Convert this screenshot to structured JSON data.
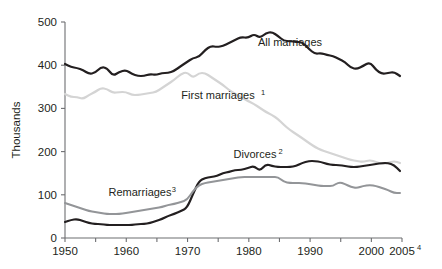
{
  "chart_data": {
    "type": "line",
    "title": "",
    "xlabel": "",
    "ylabel": "Thousands",
    "xlim": [
      1950,
      2005
    ],
    "ylim": [
      0,
      500
    ],
    "grid": false,
    "legend_position": "inline-annotations",
    "y_ticks": [
      "0",
      "100",
      "200",
      "300",
      "400",
      "500"
    ],
    "y_tick_values": [
      0,
      100,
      200,
      300,
      400,
      500
    ],
    "x_ticks": [
      "1950",
      "",
      "1960",
      "",
      "1970",
      "",
      "1980",
      "",
      "1990",
      "",
      "2000",
      "2005"
    ],
    "x_tick_values": [
      1950,
      1955,
      1960,
      1965,
      1970,
      1975,
      1980,
      1985,
      1990,
      1995,
      2000,
      2005
    ],
    "x_tick_labels_visible": [
      "1950",
      "1960",
      "1970",
      "1980",
      "1990",
      "2000",
      "2005"
    ],
    "x_last_label_superscript": "4",
    "series": [
      {
        "name": "All marriages",
        "label": "All marriages",
        "superscript": "",
        "color": "#231f20",
        "width": 2.2,
        "label_x": 290,
        "label_y": 46,
        "x": [
          1950,
          1951,
          1952,
          1953,
          1954,
          1955,
          1956,
          1957,
          1958,
          1959,
          1960,
          1961,
          1962,
          1963,
          1964,
          1965,
          1966,
          1967,
          1968,
          1969,
          1970,
          1971,
          1972,
          1973,
          1974,
          1975,
          1976,
          1977,
          1978,
          1979,
          1980,
          1981,
          1982,
          1983,
          1984,
          1985,
          1986,
          1987,
          1988,
          1989,
          1990,
          1991,
          1992,
          1993,
          1994,
          1995,
          1996,
          1997,
          1998,
          1999,
          2000,
          2001,
          2002,
          2003,
          2004,
          2005
        ],
        "values": [
          406,
          400,
          398,
          396,
          387,
          390,
          400,
          398,
          384,
          394,
          400,
          389,
          384,
          385,
          388,
          386,
          390,
          392,
          396,
          406,
          415,
          425,
          428,
          440,
          450,
          448,
          450,
          456,
          462,
          470,
          466,
          475,
          466,
          478,
          480,
          470,
          459,
          460,
          457,
          458,
          443,
          430,
          432,
          429,
          427,
          420,
          412,
          400,
          398,
          404,
          412,
          396,
          387,
          390,
          392,
          382
        ],
        "pixel_points": [
          [
            65,
            64
          ],
          [
            71,
            67
          ],
          [
            77,
            68
          ],
          [
            83,
            70
          ],
          [
            89,
            74
          ],
          [
            95,
            73
          ],
          [
            101,
            67
          ],
          [
            107,
            68
          ],
          [
            113,
            76
          ],
          [
            119,
            72
          ],
          [
            126,
            70
          ],
          [
            132,
            74
          ],
          [
            138,
            76
          ],
          [
            144,
            76
          ],
          [
            150,
            74
          ],
          [
            156,
            75
          ],
          [
            162,
            73
          ],
          [
            168,
            73
          ],
          [
            174,
            71
          ],
          [
            181,
            66
          ],
          [
            187,
            62
          ],
          [
            193,
            58
          ],
          [
            199,
            57
          ],
          [
            205,
            50
          ],
          [
            211,
            46
          ],
          [
            217,
            47
          ],
          [
            223,
            46
          ],
          [
            229,
            43
          ],
          [
            235,
            40
          ],
          [
            241,
            37
          ],
          [
            248,
            38
          ],
          [
            254,
            34
          ],
          [
            260,
            38
          ],
          [
            266,
            33
          ],
          [
            272,
            32
          ],
          [
            278,
            36
          ],
          [
            284,
            41
          ],
          [
            290,
            41
          ],
          [
            296,
            42
          ],
          [
            302,
            42
          ],
          [
            309,
            49
          ],
          [
            315,
            54
          ],
          [
            321,
            53
          ],
          [
            327,
            55
          ],
          [
            333,
            56
          ],
          [
            339,
            59
          ],
          [
            345,
            62
          ],
          [
            351,
            68
          ],
          [
            357,
            69
          ],
          [
            363,
            66
          ],
          [
            370,
            62
          ],
          [
            376,
            70
          ],
          [
            382,
            74
          ],
          [
            388,
            73
          ],
          [
            394,
            72
          ],
          [
            400,
            76
          ]
        ]
      },
      {
        "name": "First marriages",
        "label": "First marriages",
        "superscript": "1",
        "color": "#d4d4d4",
        "width": 2.2,
        "label_x": 218,
        "label_y": 99,
        "x": [
          1950,
          1955,
          1960,
          1965,
          1970,
          1975,
          1980,
          1985,
          1990,
          1995,
          2000,
          2005
        ],
        "values": [
          333,
          338,
          336,
          344,
          380,
          375,
          345,
          310,
          270,
          230,
          200,
          180
        ],
        "pixel_points": [
          [
            65,
            94
          ],
          [
            71,
            97
          ],
          [
            77,
            97
          ],
          [
            83,
            99
          ],
          [
            89,
            95
          ],
          [
            95,
            92
          ],
          [
            101,
            88
          ],
          [
            107,
            89
          ],
          [
            113,
            93
          ],
          [
            119,
            92
          ],
          [
            126,
            92
          ],
          [
            132,
            95
          ],
          [
            138,
            95
          ],
          [
            144,
            94
          ],
          [
            150,
            93
          ],
          [
            156,
            92
          ],
          [
            162,
            88
          ],
          [
            168,
            84
          ],
          [
            174,
            80
          ],
          [
            181,
            74
          ],
          [
            187,
            72
          ],
          [
            193,
            78
          ],
          [
            199,
            73
          ],
          [
            205,
            73
          ],
          [
            211,
            77
          ],
          [
            217,
            81
          ],
          [
            223,
            85
          ],
          [
            229,
            90
          ],
          [
            235,
            94
          ],
          [
            241,
            97
          ],
          [
            248,
            101
          ],
          [
            254,
            104
          ],
          [
            260,
            108
          ],
          [
            266,
            112
          ],
          [
            272,
            115
          ],
          [
            278,
            119
          ],
          [
            284,
            125
          ],
          [
            290,
            130
          ],
          [
            296,
            134
          ],
          [
            302,
            138
          ],
          [
            309,
            143
          ],
          [
            315,
            147
          ],
          [
            321,
            150
          ],
          [
            327,
            152
          ],
          [
            333,
            154
          ],
          [
            339,
            156
          ],
          [
            345,
            158
          ],
          [
            351,
            160
          ],
          [
            357,
            161
          ],
          [
            363,
            162
          ],
          [
            370,
            160
          ],
          [
            376,
            162
          ],
          [
            382,
            164
          ],
          [
            388,
            163
          ],
          [
            394,
            161
          ],
          [
            400,
            163
          ]
        ]
      },
      {
        "name": "Divorces",
        "label": "Divorces",
        "superscript": "2",
        "color": "#231f20",
        "width": 2.2,
        "label_x": 255,
        "label_y": 158,
        "x": [
          1950,
          1955,
          1960,
          1965,
          1970,
          1975,
          1980,
          1985,
          1990,
          1995,
          2000,
          2005
        ],
        "values": [
          35,
          30,
          28,
          33,
          48,
          110,
          125,
          128,
          125,
          123,
          120,
          118
        ],
        "pixel_points": [
          [
            65,
            222
          ],
          [
            71,
            220
          ],
          [
            77,
            219
          ],
          [
            83,
            221
          ],
          [
            89,
            223
          ],
          [
            95,
            224
          ],
          [
            101,
            224
          ],
          [
            107,
            225
          ],
          [
            113,
            225
          ],
          [
            119,
            225
          ],
          [
            126,
            225
          ],
          [
            132,
            225
          ],
          [
            138,
            224
          ],
          [
            144,
            224
          ],
          [
            150,
            223
          ],
          [
            156,
            221
          ],
          [
            162,
            219
          ],
          [
            168,
            216
          ],
          [
            174,
            214
          ],
          [
            181,
            211
          ],
          [
            187,
            208
          ],
          [
            193,
            194
          ],
          [
            199,
            181
          ],
          [
            205,
            178
          ],
          [
            211,
            177
          ],
          [
            217,
            176
          ],
          [
            223,
            173
          ],
          [
            229,
            172
          ],
          [
            235,
            170
          ],
          [
            241,
            170
          ],
          [
            248,
            168
          ],
          [
            254,
            166
          ],
          [
            260,
            171
          ],
          [
            266,
            164
          ],
          [
            272,
            166
          ],
          [
            278,
            167
          ],
          [
            284,
            167
          ],
          [
            290,
            167
          ],
          [
            296,
            166
          ],
          [
            302,
            163
          ],
          [
            309,
            161
          ],
          [
            315,
            161
          ],
          [
            321,
            162
          ],
          [
            327,
            164
          ],
          [
            333,
            165
          ],
          [
            339,
            165
          ],
          [
            345,
            166
          ],
          [
            351,
            167
          ],
          [
            357,
            167
          ],
          [
            363,
            166
          ],
          [
            370,
            165
          ],
          [
            376,
            164
          ],
          [
            382,
            163
          ],
          [
            388,
            163
          ],
          [
            394,
            165
          ],
          [
            400,
            171
          ]
        ]
      },
      {
        "name": "Remarriages",
        "label": "Remarriages",
        "superscript": "3",
        "color": "#939598",
        "width": 2.0,
        "label_x": 140,
        "label_y": 196,
        "x": [
          1950,
          1955,
          1960,
          1965,
          1970,
          1975,
          1980,
          1985,
          1990,
          1995,
          2000,
          2005
        ],
        "values": [
          80,
          68,
          58,
          62,
          75,
          105,
          118,
          118,
          110,
          108,
          106,
          100
        ],
        "pixel_points": [
          [
            65,
            203
          ],
          [
            71,
            205
          ],
          [
            77,
            207
          ],
          [
            83,
            209
          ],
          [
            89,
            211
          ],
          [
            95,
            212
          ],
          [
            101,
            213
          ],
          [
            107,
            214
          ],
          [
            113,
            214
          ],
          [
            119,
            214
          ],
          [
            126,
            213
          ],
          [
            132,
            212
          ],
          [
            138,
            211
          ],
          [
            144,
            210
          ],
          [
            150,
            209
          ],
          [
            156,
            208
          ],
          [
            162,
            207
          ],
          [
            168,
            205
          ],
          [
            174,
            204
          ],
          [
            181,
            202
          ],
          [
            187,
            200
          ],
          [
            193,
            191
          ],
          [
            199,
            185
          ],
          [
            205,
            183
          ],
          [
            211,
            182
          ],
          [
            217,
            181
          ],
          [
            223,
            180
          ],
          [
            229,
            179
          ],
          [
            235,
            178
          ],
          [
            241,
            177
          ],
          [
            248,
            177
          ],
          [
            254,
            177
          ],
          [
            260,
            177
          ],
          [
            266,
            177
          ],
          [
            272,
            177
          ],
          [
            278,
            177
          ],
          [
            284,
            182
          ],
          [
            290,
            183
          ],
          [
            296,
            183
          ],
          [
            302,
            183
          ],
          [
            309,
            184
          ],
          [
            315,
            185
          ],
          [
            321,
            186
          ],
          [
            327,
            186
          ],
          [
            333,
            186
          ],
          [
            339,
            182
          ],
          [
            345,
            184
          ],
          [
            351,
            187
          ],
          [
            357,
            188
          ],
          [
            363,
            186
          ],
          [
            370,
            185
          ],
          [
            376,
            186
          ],
          [
            382,
            188
          ],
          [
            388,
            190
          ],
          [
            394,
            193
          ],
          [
            400,
            193
          ]
        ]
      }
    ]
  }
}
